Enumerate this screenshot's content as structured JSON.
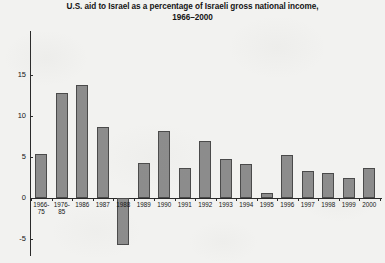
{
  "chart_data": {
    "type": "bar",
    "title": "U.S. aid to Israel as a percentage of Israeli gross national income, 1966–2000",
    "title_lines": [
      "U.S. aid to Israel as a percentage of Israeli gross national income,",
      "1966–2000"
    ],
    "xlabel": "",
    "ylabel": "",
    "ylim": [
      -5,
      15
    ],
    "yticks": [
      15,
      10,
      5,
      0,
      -5
    ],
    "ytick_labels": [
      "15",
      "10",
      "5",
      "0",
      "-5"
    ],
    "grid": false,
    "legend": false,
    "bar_color": "#8c8c8c",
    "bar_edge_color": "#4a4a4a",
    "background_color": "#f2f2f0",
    "axis_color": "#2a2a2a",
    "categories": [
      "1966-75",
      "1976-85",
      "1986",
      "1987",
      "1988",
      "1989",
      "1990",
      "1991",
      "1992",
      "1993",
      "1994",
      "1995",
      "1996",
      "1997",
      "1998",
      "1999",
      "2000"
    ],
    "category_lines": [
      [
        "1966-",
        "75"
      ],
      [
        "1976-",
        "85"
      ],
      [
        "1986",
        ""
      ],
      [
        "1987",
        ""
      ],
      [
        "1988",
        ""
      ],
      [
        "1989",
        ""
      ],
      [
        "1990",
        ""
      ],
      [
        "1991",
        ""
      ],
      [
        "1992",
        ""
      ],
      [
        "1993",
        ""
      ],
      [
        "1994",
        ""
      ],
      [
        "1995",
        ""
      ],
      [
        "1996",
        ""
      ],
      [
        "1997",
        ""
      ],
      [
        "1998",
        ""
      ],
      [
        "1999",
        ""
      ],
      [
        "2000",
        ""
      ]
    ],
    "values": [
      5.4,
      12.8,
      13.8,
      8.6,
      -5.7,
      4.3,
      8.2,
      3.6,
      7.0,
      4.8,
      4.2,
      0.6,
      5.3,
      3.3,
      3.1,
      2.4,
      3.7
    ]
  }
}
